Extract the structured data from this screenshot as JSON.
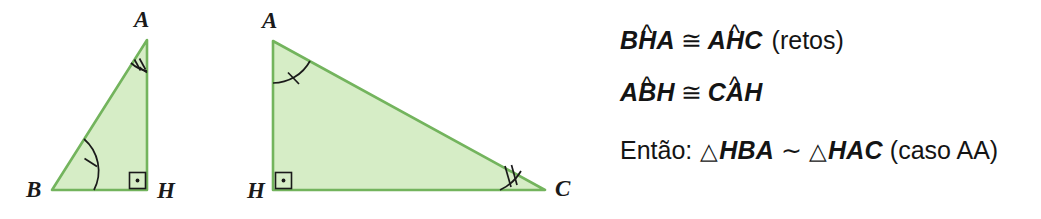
{
  "figure": {
    "colors": {
      "fill": "#d6edc6",
      "stroke": "#73b45d",
      "mark": "#1a1a1a",
      "text": "#141414",
      "background": "#ffffff"
    },
    "triangle_left": {
      "name": "triangle-BHA",
      "vertices": [
        {
          "label": "A",
          "x": 147,
          "y": 40,
          "label_x": 134,
          "label_y": 27
        },
        {
          "label": "B",
          "x": 52,
          "y": 190,
          "label_x": 26,
          "label_y": 197
        },
        {
          "label": "H",
          "x": 147,
          "y": 190,
          "label_x": 157,
          "label_y": 198
        }
      ],
      "angle_marks": [
        {
          "name": "angle-mark-A-double",
          "at": "A",
          "ticks": 2
        },
        {
          "name": "angle-mark-B-single",
          "at": "B",
          "ticks": 1
        },
        {
          "name": "right-angle-mark-H",
          "at": "H",
          "ticks": 0,
          "kind": "right-angle-dot"
        }
      ]
    },
    "triangle_right": {
      "name": "triangle-HAC",
      "vertices": [
        {
          "label": "A",
          "x": 273,
          "y": 41,
          "label_x": 262,
          "label_y": 28
        },
        {
          "label": "H",
          "x": 273,
          "y": 190,
          "label_x": 247,
          "label_y": 198
        },
        {
          "label": "C",
          "x": 545,
          "y": 190,
          "label_x": 555,
          "label_y": 196
        }
      ],
      "angle_marks": [
        {
          "name": "angle-mark-A-single",
          "at": "A",
          "ticks": 1
        },
        {
          "name": "angle-mark-C-double",
          "at": "C",
          "ticks": 2
        },
        {
          "name": "right-angle-mark-H",
          "at": "H",
          "ticks": 0,
          "kind": "right-angle-dot"
        }
      ]
    }
  },
  "proof": {
    "line1": {
      "lhs": {
        "pre": "B",
        "hat_letter": "H",
        "post": "A"
      },
      "relation": "≅",
      "rhs": {
        "pre": "A",
        "hat_letter": "H",
        "post": "C"
      },
      "note": "(retos)"
    },
    "line2": {
      "lhs": {
        "pre": "A",
        "hat_letter": "B",
        "post": "H"
      },
      "relation": "≅",
      "rhs": {
        "pre": "C",
        "hat_letter": "A",
        "post": "H"
      },
      "note": ""
    },
    "line3": {
      "prefix": "Então:",
      "triangle_glyph": "△",
      "lhs": "HBA",
      "relation": "∼",
      "rhs": "HAC",
      "note": "(caso AA)"
    },
    "hat_mark": "^"
  }
}
